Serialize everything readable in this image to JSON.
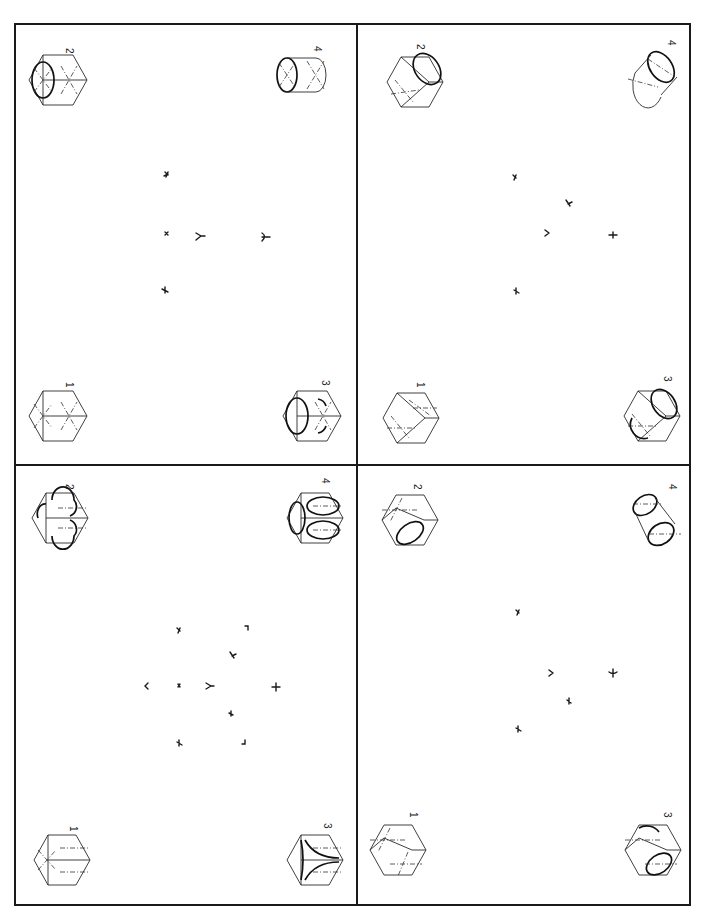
{
  "document": {
    "type": "isometric drawing exercise sheet",
    "orientation": "rotated 90 degrees",
    "colors": {
      "paper": "#ffffff",
      "ink": "#1a1a1a"
    }
  },
  "panels": [
    {
      "id": "top-left",
      "figures": [
        {
          "label": "1",
          "shape": "cube with construction lines"
        },
        {
          "label": "2",
          "shape": "cube with ellipse on one face"
        },
        {
          "label": "3",
          "shape": "cube with ellipse and arcs"
        },
        {
          "label": "4",
          "shape": "cylinder"
        }
      ]
    },
    {
      "id": "top-right",
      "figures": [
        {
          "label": "1",
          "shape": "cube with center lines"
        },
        {
          "label": "2",
          "shape": "cube with ellipse on top face"
        },
        {
          "label": "3",
          "shape": "cube with ellipse and arc"
        },
        {
          "label": "4",
          "shape": "cylinder"
        }
      ]
    },
    {
      "id": "bottom-left",
      "figures": [
        {
          "label": "1",
          "shape": "cube with center lines"
        },
        {
          "label": "2",
          "shape": "cube with arcs"
        },
        {
          "label": "3",
          "shape": "cube with three quarter arcs"
        },
        {
          "label": "4",
          "shape": "cube with ellipses on three faces"
        }
      ]
    },
    {
      "id": "bottom-right",
      "figures": [
        {
          "label": "1",
          "shape": "cube with center lines"
        },
        {
          "label": "2",
          "shape": "cube with ellipse on side face"
        },
        {
          "label": "3",
          "shape": "cube with ellipse and arc"
        },
        {
          "label": "4",
          "shape": "cylinder"
        }
      ]
    }
  ]
}
